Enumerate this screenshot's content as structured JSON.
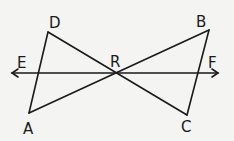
{
  "diagram": {
    "points": {
      "A": {
        "label": "A",
        "x": 29,
        "y": 113
      },
      "B": {
        "label": "B",
        "x": 209,
        "y": 30
      },
      "C": {
        "label": "C",
        "x": 187,
        "y": 115
      },
      "D": {
        "label": "D",
        "x": 48,
        "y": 32
      },
      "R": {
        "label": "R",
        "x": 116,
        "y": 73
      },
      "E": {
        "label": "E",
        "x": 12,
        "y": 73
      },
      "F": {
        "label": "F",
        "x": 218,
        "y": 73
      }
    },
    "segments": [
      [
        "A",
        "D"
      ],
      [
        "D",
        "C"
      ],
      [
        "A",
        "B"
      ],
      [
        "B",
        "C"
      ]
    ],
    "line": [
      "E",
      "F"
    ],
    "colors": {
      "stroke": "#1a1a1a",
      "background": "#f4f4f2"
    }
  }
}
